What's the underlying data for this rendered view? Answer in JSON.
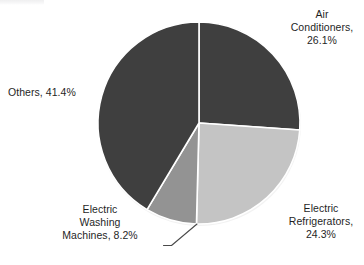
{
  "chart_data": {
    "type": "pie",
    "title": "",
    "xlabel": "",
    "ylabel": "",
    "legend_position": "none",
    "grid": false,
    "start_angle_deg": 0,
    "direction": "clockwise",
    "categories": [
      "Air Conditioners",
      "Electric Refrigerators",
      "Electric Washing Machines",
      "Others"
    ],
    "values": [
      26.1,
      24.3,
      8.2,
      41.4
    ],
    "units": "%",
    "slices": [
      {
        "label": "Air Conditioners",
        "value": 26.1,
        "value_text": "26.1%",
        "label_text": "Air\nConditioners,\n26.1%",
        "color": "#3f3f3f",
        "start_angle_deg": 0,
        "end_angle_deg": 93.96,
        "has_leader_line": false
      },
      {
        "label": "Electric Refrigerators",
        "value": 24.3,
        "value_text": "24.3%",
        "label_text": "Electric\nRefrigerators,\n24.3%",
        "color": "#c4c4c4",
        "start_angle_deg": 93.96,
        "end_angle_deg": 181.44,
        "has_leader_line": false
      },
      {
        "label": "Electric Washing Machines",
        "value": 8.2,
        "value_text": "8.2%",
        "label_text": "Electric\nWashing\nMachines, 8.2%",
        "color": "#939393",
        "start_angle_deg": 181.44,
        "end_angle_deg": 210.96,
        "has_leader_line": true
      },
      {
        "label": "Others",
        "value": 41.4,
        "value_text": "41.4%",
        "label_text": "Others, 41.4%",
        "color": "#3f3f3f",
        "start_angle_deg": 210.96,
        "end_angle_deg": 360,
        "has_leader_line": false
      }
    ],
    "colors": {
      "dark_gray": "#3f3f3f",
      "light_gray": "#c4c4c4",
      "medium_gray": "#939393",
      "slice_border": "#ffffff",
      "background": "#ffffff",
      "text": "#1f1f1f",
      "leader_line": "#4a4a4a"
    },
    "geometry": {
      "center_x": 199,
      "center_y": 123,
      "radius": 101
    }
  },
  "labels": {
    "air_conditioners": "Air\nConditioners,\n26.1%",
    "electric_refrigerators": "Electric\nRefrigerators,\n24.3%",
    "electric_washing_machines": "Electric\nWashing\nMachines, 8.2%",
    "others": "Others, 41.4%"
  }
}
